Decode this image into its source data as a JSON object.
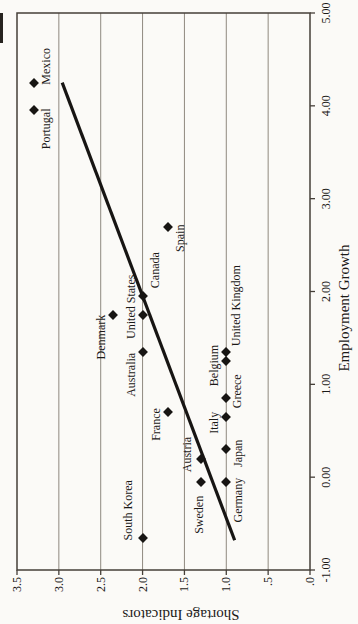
{
  "chart_data": {
    "type": "scatter",
    "title": "",
    "xlabel": "Employment Growth",
    "ylabel": "Shortage Indicators",
    "xlim": [
      -1.0,
      5.0
    ],
    "ylim": [
      0.0,
      3.5
    ],
    "rotation_deg": -90,
    "grid": "y-major-only",
    "x_ticks": [
      {
        "value": -1,
        "label": "-1.00"
      },
      {
        "value": 0,
        "label": "0.00"
      },
      {
        "value": 1,
        "label": "1.00"
      },
      {
        "value": 2,
        "label": "2.00"
      },
      {
        "value": 3,
        "label": "3.00"
      },
      {
        "value": 4,
        "label": "4.00"
      },
      {
        "value": 5,
        "label": "5.00"
      }
    ],
    "y_ticks": [
      {
        "value": 3.5,
        "label": "3.5"
      },
      {
        "value": 3.0,
        "label": "3.0"
      },
      {
        "value": 2.5,
        "label": "2.5"
      },
      {
        "value": 2.0,
        "label": "2.0"
      },
      {
        "value": 1.5,
        "label": "1.5"
      },
      {
        "value": 1.0,
        "label": "1.0"
      },
      {
        "value": 0.5,
        "label": ".5"
      },
      {
        "value": 0.0,
        "label": ".0"
      }
    ],
    "gridlines_y": [
      0.5,
      1.0,
      1.5,
      2.0,
      2.5,
      3.0
    ],
    "points": [
      {
        "name": "Mexico",
        "x": 4.25,
        "y": 3.3,
        "anchor": "left",
        "ox": -2,
        "oy": 12
      },
      {
        "name": "Portugal",
        "x": 3.95,
        "y": 3.3,
        "anchor": "right",
        "ox": 2,
        "oy": 12
      },
      {
        "name": "Spain",
        "x": 2.7,
        "y": 1.7,
        "anchor": "right",
        "ox": 2,
        "oy": 12
      },
      {
        "name": "Canada",
        "x": 1.95,
        "y": 2.0,
        "anchor": "left",
        "ox": 8,
        "oy": 12
      },
      {
        "name": "United States",
        "x": 1.75,
        "y": 2.0,
        "anchor": "center",
        "ox": 8,
        "oy": -12
      },
      {
        "name": "Denmark",
        "x": 1.75,
        "y": 2.35,
        "anchor": "right",
        "ox": 0,
        "oy": -12
      },
      {
        "name": "Australia",
        "x": 1.35,
        "y": 2.0,
        "anchor": "right",
        "ox": -1,
        "oy": -12
      },
      {
        "name": "Belgium",
        "x": 1.35,
        "y": 1.0,
        "anchor": "right",
        "ox": 7,
        "oy": -12
      },
      {
        "name": "United Kingdom",
        "x": 1.25,
        "y": 1.0,
        "anchor": "left",
        "ox": 15,
        "oy": 10
      },
      {
        "name": "Greece",
        "x": 0.85,
        "y": 1.0,
        "anchor": "left",
        "ox": -10,
        "oy": 11
      },
      {
        "name": "Italy",
        "x": 0.65,
        "y": 1.0,
        "anchor": "right",
        "ox": 5,
        "oy": -12
      },
      {
        "name": "Japan",
        "x": 0.3,
        "y": 1.0,
        "anchor": "center",
        "ox": -4,
        "oy": 12
      },
      {
        "name": "Germany",
        "x": -0.05,
        "y": 1.0,
        "anchor": "right",
        "ox": 4,
        "oy": 12
      },
      {
        "name": "France",
        "x": 0.7,
        "y": 1.7,
        "anchor": "right",
        "ox": 4,
        "oy": -12
      },
      {
        "name": "Austria",
        "x": 0.2,
        "y": 1.3,
        "anchor": "center",
        "ox": 4,
        "oy": -14
      },
      {
        "name": "Sweden",
        "x": -0.05,
        "y": 1.3,
        "anchor": "right",
        "ox": -14,
        "oy": -2
      },
      {
        "name": "South Korea",
        "x": -0.65,
        "y": 2.0,
        "anchor": "left",
        "ox": -3,
        "oy": -15
      }
    ],
    "trendline": {
      "x1": -0.68,
      "y1": 0.9,
      "x2": 4.25,
      "y2": 2.96
    },
    "marker": {
      "shape": "diamond",
      "color": "#171513",
      "size": 7
    }
  },
  "colors": {
    "background": "#fbfaf7",
    "plot_border": "#453f38",
    "gridline": "#8f897f",
    "text": "#1b1917",
    "trendline": "#171513"
  }
}
